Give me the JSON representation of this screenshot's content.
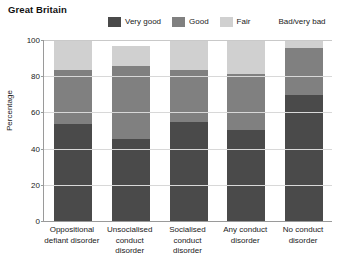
{
  "chart_data": {
    "type": "bar",
    "title": "Great Britain",
    "xlabel": "",
    "ylabel": "Percentage",
    "ylim": [
      0,
      100
    ],
    "yticks": [
      0,
      20,
      40,
      60,
      80,
      100
    ],
    "grid": true,
    "stacked": true,
    "legend_position": "top",
    "categories": [
      "Oppositional defiant disorder",
      "Unsocialised conduct disorder",
      "Socialised conduct disorder",
      "Any conduct disorder",
      "No conduct disorder"
    ],
    "series": [
      {
        "name": "Very good",
        "color": "#4a4a4a",
        "values": [
          54,
          46,
          55,
          51,
          70
        ]
      },
      {
        "name": "Good",
        "color": "#808080",
        "values": [
          30,
          40,
          29,
          31,
          26
        ]
      },
      {
        "name": "Fair",
        "color": "#d0d0d0",
        "values": [
          16,
          11,
          16,
          18,
          4
        ]
      },
      {
        "name": "Bad/very bad",
        "color": "#ffffff",
        "values": [
          0,
          3,
          0,
          0,
          0
        ]
      }
    ]
  },
  "title": {
    "text": "Great Britain"
  },
  "legend": {
    "items": [
      {
        "label": "Very good",
        "color": "#4a4a4a"
      },
      {
        "label": "Good",
        "color": "#808080"
      },
      {
        "label": "Fair",
        "color": "#d0d0d0"
      },
      {
        "label": "Bad/very bad",
        "color": "#ffffff"
      }
    ]
  },
  "yaxis": {
    "label": "Percentage",
    "ticks": [
      "0",
      "20",
      "40",
      "60",
      "80",
      "100"
    ]
  },
  "xaxis": {
    "labels": [
      [
        "Oppositional",
        "defiant disorder"
      ],
      [
        "Unsocialised",
        "conduct",
        "disorder"
      ],
      [
        "Socialised",
        "conduct",
        "disorder"
      ],
      [
        "Any conduct",
        "disorder"
      ],
      [
        "No conduct",
        "disorder"
      ]
    ]
  }
}
